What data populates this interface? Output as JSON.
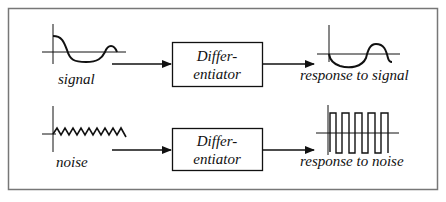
{
  "diagram": {
    "rows": [
      {
        "id": "signal",
        "input_label": "signal",
        "input_waveform": "smooth-wave-icon",
        "block": {
          "line1": "Differ-",
          "line2": "entiator"
        },
        "output_label": "response to signal",
        "output_waveform": "smooth-derivative-wave-icon"
      },
      {
        "id": "noise",
        "input_label": "noise",
        "input_waveform": "zigzag-noise-icon",
        "block": {
          "line1": "Differ-",
          "line2": "entiator"
        },
        "output_label": "response to noise",
        "output_waveform": "square-wave-icon"
      }
    ],
    "colors": {
      "stroke": "#111111",
      "frame": "#777777",
      "background": "#ffffff"
    }
  }
}
